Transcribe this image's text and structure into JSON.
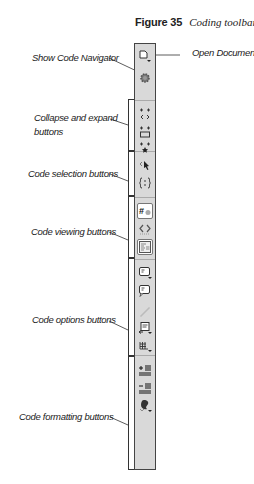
{
  "figure": {
    "number": "Figure 35",
    "caption": "Coding toolbar"
  },
  "callouts": {
    "open_documents": "Open Documents",
    "show_code_navigator": "Show Code Navigator",
    "collapse_expand_line1": "Collapse and expand",
    "collapse_expand_line2": "buttons",
    "code_selection": "Code selection buttons",
    "code_viewing": "Code viewing buttons",
    "code_options": "Code options buttons",
    "code_formatting": "Code formatting buttons"
  },
  "toolbar": {
    "background": "#d9d9d9",
    "buttons": [
      {
        "id": "open-documents",
        "icon": "document-dropdown-icon"
      },
      {
        "id": "show-code-navigator",
        "icon": "gear-navigator-icon"
      },
      {
        "id": "collapse-full-tag",
        "icon": "collapse-tag-icon"
      },
      {
        "id": "collapse-selection",
        "icon": "collapse-selection-icon"
      },
      {
        "id": "expand-all",
        "icon": "expand-all-icon"
      },
      {
        "id": "select-parent-tag",
        "icon": "select-parent-tag-icon"
      },
      {
        "id": "balance-braces",
        "icon": "balance-braces-icon"
      },
      {
        "id": "line-numbers",
        "icon": "line-numbers-icon"
      },
      {
        "id": "highlight-invalid-code",
        "icon": "highlight-invalid-icon"
      },
      {
        "id": "syntax-error-alerts",
        "icon": "syntax-alerts-icon"
      },
      {
        "id": "apply-comment",
        "icon": "comment-apply-icon"
      },
      {
        "id": "remove-comment",
        "icon": "comment-remove-icon"
      },
      {
        "id": "wrap-tag",
        "icon": "wrap-tag-icon"
      },
      {
        "id": "recent-snippets",
        "icon": "recent-snippets-icon"
      },
      {
        "id": "move-css",
        "icon": "move-css-icon"
      },
      {
        "id": "indent-code",
        "icon": "indent-icon"
      },
      {
        "id": "outdent-code",
        "icon": "outdent-icon"
      },
      {
        "id": "format-source-code",
        "icon": "format-source-icon"
      }
    ]
  }
}
